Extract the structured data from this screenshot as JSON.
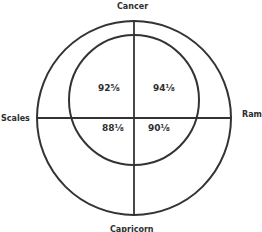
{
  "diagram": {
    "type": "two-circle quadrant diagram",
    "labels": {
      "top": "Cancer",
      "left": "Scales",
      "right": "Ram",
      "bottom": "Capricorn"
    },
    "quadrant_values": {
      "upper_left": "92⅝",
      "upper_right": "94⅛",
      "lower_left": "88⅛",
      "lower_right": "90⅛"
    },
    "colors": {
      "stroke": "#333333",
      "background": "#ffffff"
    }
  }
}
